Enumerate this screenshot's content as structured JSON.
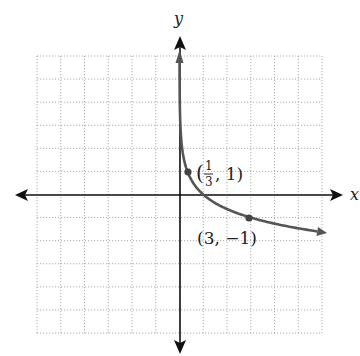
{
  "chart_data": {
    "type": "line",
    "title": "",
    "function": "y = log_(1/3)(x)",
    "xlabel": "x",
    "ylabel": "y",
    "xlim": [
      -6,
      6
    ],
    "ylim": [
      -6,
      6
    ],
    "grid": true,
    "grid_step": 1,
    "tick_labels_shown": false,
    "series": [
      {
        "name": "y = log_(1/3)(x)",
        "color": "#555555",
        "x": [
          0.005,
          0.02,
          0.05,
          0.1,
          0.2,
          0.333,
          0.5,
          1,
          2,
          3,
          4,
          5,
          6
        ],
        "y": [
          4.82,
          3.56,
          2.73,
          2.1,
          1.46,
          1.0,
          0.63,
          0,
          -0.63,
          -1.0,
          -1.26,
          -1.46,
          -1.63
        ]
      }
    ],
    "annotations": [
      {
        "point": [
          0.3333,
          1
        ],
        "label_num": "1",
        "label_den": "3",
        "label_rest": ", 1)",
        "label_open": "("
      },
      {
        "point": [
          3,
          -1
        ],
        "label": "(3, −1)"
      }
    ]
  },
  "labels": {
    "x_axis": "x",
    "y_axis": "y",
    "p1_open": "(",
    "p1_num": "1",
    "p1_den": "3",
    "p1_rest": ", 1)",
    "p2": "(3, −1)"
  },
  "colors": {
    "grid": "#999999",
    "axis": "#111111",
    "curve": "#555555"
  }
}
